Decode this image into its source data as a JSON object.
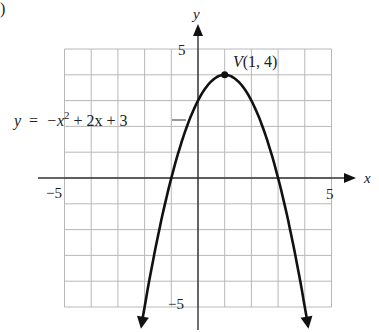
{
  "panel_marker": ")",
  "chart_data": {
    "type": "line",
    "title": "",
    "function": "y = -x^2 + 2x + 3",
    "equation_label": {
      "y": "y",
      "eq": "=",
      "neg": "−x",
      "sup": "2",
      "rest": "+ 2x + 3"
    },
    "vertex": {
      "label": "V(1, 4)",
      "x": 1,
      "y": 4
    },
    "xlabel": "x",
    "ylabel": "y",
    "xlim": [
      -5,
      5
    ],
    "ylim": [
      -5,
      5
    ],
    "x_tick_labels": {
      "min": "−5",
      "max": "5"
    },
    "y_tick_labels": {
      "min": "−5",
      "max": "5"
    },
    "grid": true,
    "grid_step": 1,
    "x": [
      -2.1,
      -1,
      0,
      1,
      2,
      3,
      4.1
    ],
    "values": [
      -5.61,
      0,
      3,
      4,
      3,
      0,
      -5.61
    ],
    "x_intercepts": [
      -1,
      3
    ],
    "y_intercept": 3,
    "arrows_on_ends": true
  }
}
